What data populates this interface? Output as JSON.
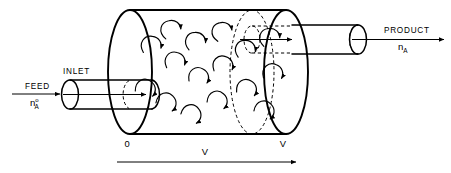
{
  "diagram": {
    "type": "process-flow-schematic",
    "background_color": "#ffffff",
    "line_color": "#000000"
  },
  "labels": {
    "feed": "FEED",
    "feed_symbol_base": "n",
    "feed_symbol_superscript": "o",
    "feed_symbol_subscript": "A",
    "inlet": "INLET",
    "product": "PRODUCT",
    "product_symbol_base": "n",
    "product_symbol_subscript": "A",
    "volume_start_tick": "0",
    "volume_end_tick": "V",
    "volume_axis": "V"
  },
  "icons": {
    "feed_flow_arrow": "arrow-right-icon",
    "inlet_pipe_arrow": "arrow-right-icon",
    "outlet_pipe_arrow": "arrow-right-icon",
    "product_flow_arrow": "arrow-right-icon",
    "volume_axis_arrow": "arrow-right-icon",
    "mixing_eddy": "curved-arrow-icon"
  },
  "geometry": {
    "tank_left_face_x": 130,
    "tank_right_face_x": 286,
    "tank_center_y": 72,
    "tank_radius_y": 62,
    "tank_radius_x": 22,
    "inlet_pipe_y": 94,
    "outlet_pipe_y": 38
  },
  "eddies": [
    {
      "cx": 152,
      "cy": 44,
      "rot": -20
    },
    {
      "cx": 147,
      "cy": 88,
      "rot": 10
    },
    {
      "cx": 171,
      "cy": 28,
      "rot": -40
    },
    {
      "cx": 176,
      "cy": 60,
      "rot": -15
    },
    {
      "cx": 168,
      "cy": 102,
      "rot": 20
    },
    {
      "cx": 196,
      "cy": 40,
      "rot": -30
    },
    {
      "cx": 200,
      "cy": 76,
      "rot": 0
    },
    {
      "cx": 193,
      "cy": 114,
      "rot": 25
    },
    {
      "cx": 222,
      "cy": 30,
      "rot": -45
    },
    {
      "cx": 224,
      "cy": 64,
      "rot": -10
    },
    {
      "cx": 219,
      "cy": 100,
      "rot": 15
    },
    {
      "cx": 246,
      "cy": 48,
      "rot": -25
    },
    {
      "cx": 248,
      "cy": 88,
      "rot": 5
    },
    {
      "cx": 270,
      "cy": 36,
      "rot": -35
    },
    {
      "cx": 274,
      "cy": 72,
      "rot": -5
    },
    {
      "cx": 266,
      "cy": 110,
      "rot": 20
    }
  ]
}
